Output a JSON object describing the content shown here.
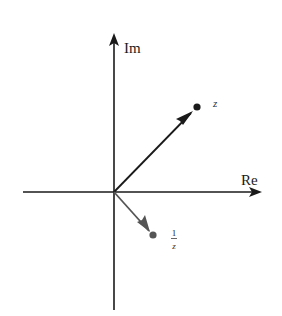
{
  "diagram": {
    "axes": {
      "real_label": "Re",
      "imaginary_label": "Im"
    },
    "vectors": [
      {
        "name": "z",
        "label": "z",
        "color": "#1a1a1a"
      },
      {
        "name": "reciprocal",
        "label_numerator": "1",
        "label_denominator": "z",
        "color": "#555555"
      }
    ],
    "colors": {
      "axis": "#1a1a1a",
      "z_vector": "#1a1a1a",
      "reciprocal_vector": "#555555",
      "background": "#ffffff"
    }
  }
}
